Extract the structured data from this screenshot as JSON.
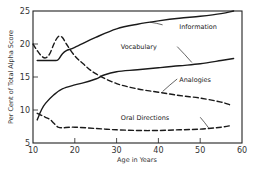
{
  "chart_data": {
    "type": "line",
    "title": "",
    "xlabel": "Age in Years",
    "ylabel": "Per Cent of Total Alpha Score",
    "xlim": [
      10,
      60
    ],
    "ylim": [
      5,
      25
    ],
    "xticks": [
      10,
      20,
      30,
      40,
      50,
      60
    ],
    "yticks": [
      5,
      10,
      15,
      20,
      25
    ],
    "grid": false,
    "legend": "inline annotations",
    "series": [
      {
        "name": "Information",
        "style": "solid",
        "x": [
          11,
          13,
          15,
          16,
          17,
          18,
          20,
          25,
          30,
          35,
          40,
          45,
          50,
          55,
          58
        ],
        "y": [
          17.5,
          17.5,
          17.5,
          17.6,
          18.5,
          19.0,
          19.5,
          21.0,
          22.3,
          23.0,
          23.5,
          23.9,
          24.2,
          24.6,
          25.0
        ]
      },
      {
        "name": "Vocabulary",
        "style": "solid",
        "x": [
          11,
          12,
          13,
          15,
          17,
          20,
          22,
          25,
          27,
          30,
          35,
          40,
          45,
          50,
          55,
          58
        ],
        "y": [
          8.5,
          10.0,
          11.0,
          12.3,
          13.2,
          13.8,
          14.1,
          14.7,
          15.3,
          15.8,
          16.1,
          16.4,
          16.7,
          17.0,
          17.5,
          17.8
        ]
      },
      {
        "name": "Analogies",
        "style": "dashed",
        "x": [
          10,
          11,
          12,
          13,
          14,
          15,
          16,
          17,
          18,
          20,
          22,
          25,
          30,
          35,
          40,
          45,
          50,
          55,
          57
        ],
        "y": [
          20.0,
          19.0,
          18.2,
          17.9,
          18.5,
          20.0,
          21.1,
          21.0,
          20.0,
          18.2,
          17.0,
          15.5,
          14.0,
          13.2,
          12.7,
          12.2,
          11.8,
          11.2,
          10.8
        ]
      },
      {
        "name": "Oral Directions",
        "style": "dashed",
        "x": [
          11,
          12,
          13,
          14,
          15,
          16,
          17,
          20,
          25,
          30,
          35,
          40,
          45,
          50,
          55,
          57
        ],
        "y": [
          9.5,
          9.2,
          8.9,
          8.6,
          8.0,
          7.4,
          7.3,
          7.4,
          7.2,
          7.0,
          6.9,
          6.9,
          7.0,
          7.1,
          7.4,
          7.6
        ]
      }
    ],
    "annotations": [
      {
        "text": "Information",
        "x": 45,
        "y": 22.3
      },
      {
        "text": "Vocabulary",
        "x": 31,
        "y": 19.3
      },
      {
        "text": "Analogies",
        "x": 45,
        "y": 14.3
      },
      {
        "text": "Oral Directions",
        "x": 31,
        "y": 8.5
      }
    ]
  }
}
